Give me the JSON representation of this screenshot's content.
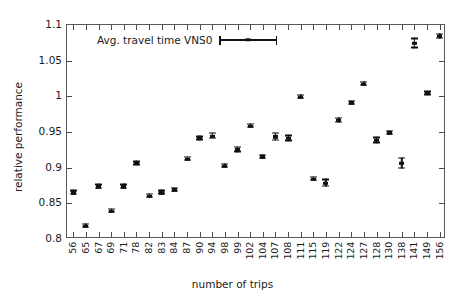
{
  "chart_data": {
    "type": "scatter",
    "title": "",
    "xlabel": "number of trips",
    "ylabel": "relative performance",
    "ylim": [
      0.8,
      1.1
    ],
    "yticks": [
      0.8,
      0.85,
      0.9,
      0.95,
      1,
      1.05,
      1.1
    ],
    "ytick_labels": [
      "0.8",
      "0.85",
      "0.9",
      "0.95",
      "1",
      "1.05",
      "1.1"
    ],
    "grid": false,
    "legend_position": "top-left",
    "legend": [
      "Avg. travel time VNS0"
    ],
    "categories": [
      "56",
      "65",
      "67",
      "69",
      "71",
      "78",
      "82",
      "83",
      "84",
      "87",
      "90",
      "94",
      "98",
      "99",
      "102",
      "104",
      "107",
      "108",
      "111",
      "115",
      "119",
      "122",
      "124",
      "127",
      "128",
      "130",
      "138",
      "141",
      "149",
      "156"
    ],
    "series": [
      {
        "name": "Avg. travel time VNS0",
        "values": [
          0.865,
          0.818,
          0.873,
          0.839,
          0.873,
          0.906,
          0.86,
          0.865,
          0.869,
          0.912,
          0.941,
          0.944,
          0.902,
          0.925,
          0.958,
          0.915,
          0.943,
          0.941,
          0.999,
          0.884,
          0.878,
          0.966,
          0.991,
          1.017,
          0.938,
          0.949,
          0.906,
          1.074,
          1.004,
          1.084
        ],
        "errors": [
          0.0035,
          0.003,
          0.0035,
          0.003,
          0.0035,
          0.003,
          0.003,
          0.003,
          0.003,
          0.003,
          0.003,
          0.0045,
          0.003,
          0.004,
          0.003,
          0.003,
          0.006,
          0.0045,
          0.002,
          0.003,
          0.0055,
          0.004,
          0.002,
          0.003,
          0.0045,
          0.0025,
          0.008,
          0.0075,
          0.003,
          0.004
        ]
      }
    ]
  },
  "axes": {
    "y_title": "relative performance",
    "x_title": "number of trips"
  },
  "legend": {
    "entry_label": "Avg. travel time VNS0"
  }
}
